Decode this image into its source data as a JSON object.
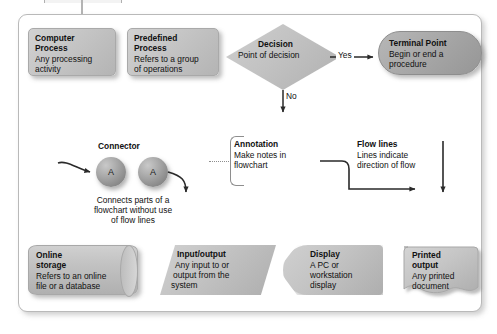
{
  "diagram": {
    "frame": {
      "border_color": "#b9b9b9",
      "background": "#ffffff"
    },
    "palette": {
      "shape_light": "#c6c6c6",
      "shape_dark": "#9b9b9b",
      "line": "#2a2a2a",
      "text": "#111111",
      "bracket": "#8e8e8e"
    },
    "shapes": [
      {
        "id": "computer-process",
        "shape": "rounded-rectangle",
        "title": "Computer",
        "title2": "Process",
        "lines": [
          "Any processing",
          "activity"
        ]
      },
      {
        "id": "predefined-process",
        "shape": "rounded-rectangle",
        "title": "Predefined",
        "title2": "Process",
        "lines": [
          "Refers to a group",
          "of operations"
        ]
      },
      {
        "id": "decision",
        "shape": "diamond",
        "title": "Decision",
        "lines": [
          "Point of decision"
        ]
      },
      {
        "id": "terminal-point",
        "shape": "stadium",
        "title": "Terminal Point",
        "lines": [
          "Begin or end a",
          "procedure"
        ]
      },
      {
        "id": "connector",
        "shape": "circle",
        "title": "Connector",
        "symbol": "A",
        "caption": [
          "Connects parts of a",
          "flowchart without use",
          "of flow lines"
        ]
      },
      {
        "id": "annotation",
        "shape": "bracket",
        "title": "Annotation",
        "lines": [
          "Make notes in",
          "flowchart"
        ]
      },
      {
        "id": "flow-lines",
        "shape": "arrow",
        "title": "Flow lines",
        "lines": [
          "Lines indicate",
          "direction of flow"
        ]
      },
      {
        "id": "online-storage",
        "shape": "cylinder",
        "title": "Online",
        "title2": "storage",
        "lines": [
          "Refers to an online",
          "file or a database"
        ]
      },
      {
        "id": "input-output",
        "shape": "parallelogram",
        "title": "Input/output",
        "lines": [
          "Any input to or",
          "output from the",
          "system"
        ]
      },
      {
        "id": "display",
        "shape": "display",
        "title": "Display",
        "lines": [
          "A PC or",
          "workstation",
          "display"
        ]
      },
      {
        "id": "printed-output",
        "shape": "document",
        "title": "Printed",
        "title2": "output",
        "lines": [
          "Any printed",
          "document"
        ]
      }
    ],
    "edge_labels": {
      "yes": "Yes",
      "no": "No"
    }
  }
}
